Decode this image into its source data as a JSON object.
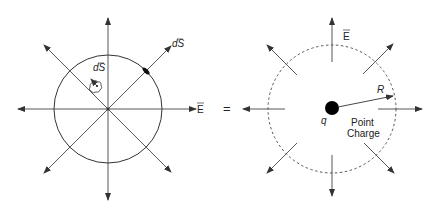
{
  "diagram": {
    "colors": {
      "line": "#333333",
      "background": "#ffffff",
      "charge": "#000000"
    },
    "left_figure": {
      "label_dS_inner": "dS",
      "label_dS_outer": "dS",
      "label_E": "E"
    },
    "equals_sign": "=",
    "right_figure": {
      "label_E": "E",
      "label_R": "R",
      "label_q": "q",
      "label_point": "Point",
      "label_charge": "Charge"
    }
  }
}
